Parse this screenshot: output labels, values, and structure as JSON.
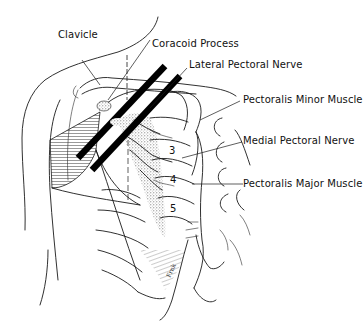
{
  "figure": {
    "labels": {
      "clavicle": "Clavicle",
      "coracoid_process": "Coracoid Process",
      "lateral_pectoral_nerve": "Lateral Pectoral Nerve",
      "pectoralis_minor": "Pectoralis Minor Muscle",
      "medial_pectoral_nerve": "Medial Pectoral Nerve",
      "pectoralis_major": "Pectoralis Major Muscle"
    },
    "rib_numbers": [
      "3",
      "4",
      "5"
    ],
    "signature": "Frnk",
    "colors": {
      "line": "#1a1a1a",
      "stipple": "#8a8a8a",
      "background": "#ffffff"
    }
  }
}
